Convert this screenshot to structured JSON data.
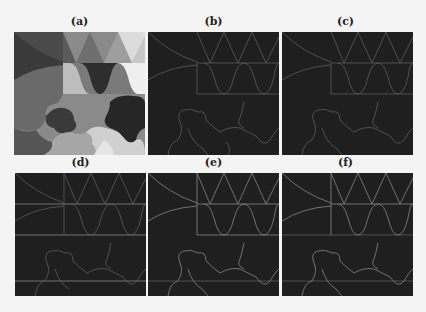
{
  "figure": {
    "panels": [
      {
        "id": "a",
        "label": "(a)",
        "type": "segmentation-map"
      },
      {
        "id": "b",
        "label": "(b)",
        "type": "edge-map"
      },
      {
        "id": "c",
        "label": "(c)",
        "type": "edge-map"
      },
      {
        "id": "d",
        "label": "(d)",
        "type": "edge-map"
      },
      {
        "id": "e",
        "label": "(e)",
        "type": "edge-map"
      },
      {
        "id": "f",
        "label": "(f)",
        "type": "edge-map"
      }
    ],
    "colors": {
      "background": "#f4f4f4",
      "edge_panel_bg": "#1f1f1f",
      "edge_line": "#6a6a6a"
    }
  }
}
